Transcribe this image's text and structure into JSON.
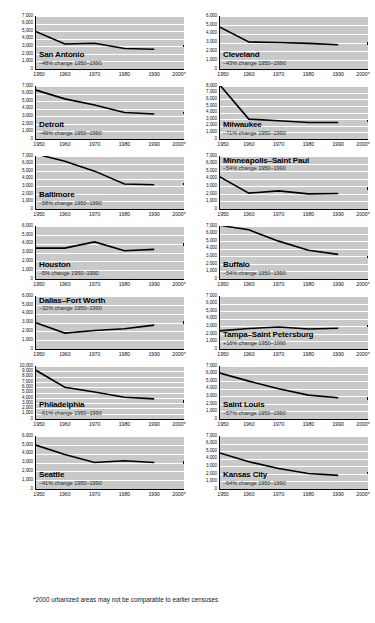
{
  "footnote": "*2000 urbanized areas may not be comparable to earlier censuses",
  "axis": {
    "x_ticks": [
      "1950",
      "1960",
      "1970",
      "1980",
      "1990",
      "2000*"
    ]
  },
  "chart_data": [
    {
      "type": "line",
      "title": "San Antonio",
      "subtitle": "–48% change 1950–1990",
      "title_position": "bottom",
      "xlabel": "",
      "ylabel": "",
      "grid": true,
      "legend": "none",
      "x": [
        "1950",
        "1960",
        "1970",
        "1980",
        "1990"
      ],
      "values": [
        5000,
        3300,
        3400,
        2700,
        2600
      ],
      "marker_2000": 3000,
      "ylim": [
        0,
        7000
      ],
      "ytick_step": 1000,
      "ytick_labels": [
        "0",
        "1,000",
        "2,000",
        "3,000",
        "4,000",
        "5,000",
        "6,000",
        "7,000"
      ]
    },
    {
      "type": "line",
      "title": "Cleveland",
      "subtitle": "–43% change 1950–1990",
      "title_position": "bottom",
      "xlabel": "",
      "ylabel": "",
      "grid": true,
      "legend": "none",
      "x": [
        "1950",
        "1960",
        "1970",
        "1980",
        "1990"
      ],
      "values": [
        4800,
        3050,
        3000,
        2900,
        2750
      ],
      "marker_2000": 2900,
      "ylim": [
        0,
        6000
      ],
      "ytick_step": 1000,
      "ytick_labels": [
        "0",
        "1,000",
        "2,000",
        "3,000",
        "4,000",
        "5,000",
        "6,000"
      ]
    },
    {
      "type": "line",
      "title": "Detroit",
      "subtitle": "–49% change 1950–1990",
      "title_position": "bottom",
      "xlabel": "",
      "ylabel": "",
      "grid": true,
      "legend": "none",
      "x": [
        "1950",
        "1960",
        "1970",
        "1980",
        "1990"
      ],
      "values": [
        6500,
        5300,
        4500,
        3500,
        3300
      ],
      "marker_2000": 3400,
      "ylim": [
        0,
        7000
      ],
      "ytick_step": 1000,
      "ytick_labels": [
        "0",
        "1,000",
        "2,000",
        "3,000",
        "4,000",
        "5,000",
        "6,000",
        "7,000"
      ]
    },
    {
      "type": "line",
      "title": "Milwaukee",
      "subtitle": "–71% change 1950–1990",
      "title_position": "bottom",
      "xlabel": "",
      "ylabel": "",
      "grid": true,
      "legend": "none",
      "x": [
        "1950",
        "1960",
        "1970",
        "1980",
        "1990"
      ],
      "values": [
        8300,
        3000,
        2750,
        2500,
        2500
      ],
      "marker_2000": 2700,
      "ylim": [
        0,
        8000
      ],
      "ytick_step": 1000,
      "ytick_labels": [
        "0",
        "1,000",
        "2,000",
        "3,000",
        "4,000",
        "5,000",
        "6,000",
        "7,000",
        "8,000"
      ]
    },
    {
      "type": "line",
      "title": "Baltimore",
      "subtitle": "–58% change 1950–1990",
      "title_position": "bottom",
      "xlabel": "",
      "ylabel": "",
      "grid": true,
      "legend": "none",
      "x": [
        "1950",
        "1960",
        "1970",
        "1980",
        "1990"
      ],
      "values": [
        7300,
        6300,
        5000,
        3300,
        3200
      ],
      "marker_2000": 3300,
      "ylim": [
        0,
        7000
      ],
      "ytick_step": 1000,
      "ytick_labels": [
        "0",
        "1,000",
        "2,000",
        "3,000",
        "4,000",
        "5,000",
        "6,000",
        "7,000"
      ]
    },
    {
      "type": "line",
      "title": "Minneapolis–Saint Paul",
      "subtitle": "–54% change 1950–1990",
      "title_position": "top",
      "xlabel": "",
      "ylabel": "",
      "grid": true,
      "legend": "none",
      "x": [
        "1950",
        "1960",
        "1970",
        "1980",
        "1990"
      ],
      "values": [
        4300,
        2100,
        2400,
        2000,
        2050
      ],
      "marker_2000": 2700,
      "ylim": [
        0,
        7000
      ],
      "ytick_step": 1000,
      "ytick_labels": [
        "0",
        "1,000",
        "2,000",
        "3,000",
        "4,000",
        "5,000",
        "6,000",
        "7,000"
      ]
    },
    {
      "type": "line",
      "title": "Houston",
      "subtitle": "–5% change 1950–1990",
      "title_position": "bottom",
      "xlabel": "",
      "ylabel": "",
      "grid": true,
      "legend": "none",
      "x": [
        "1950",
        "1960",
        "1970",
        "1980",
        "1990"
      ],
      "values": [
        3500,
        3500,
        4200,
        3200,
        3350
      ],
      "marker_2000": 3900,
      "ylim": [
        0,
        6000
      ],
      "ytick_step": 1000,
      "ytick_labels": [
        "0",
        "1,000",
        "2,000",
        "3,000",
        "4,000",
        "5,000",
        "6,000"
      ]
    },
    {
      "type": "line",
      "title": "Buffalo",
      "subtitle": "–54% change 1950–1990",
      "title_position": "bottom",
      "xlabel": "",
      "ylabel": "",
      "grid": true,
      "legend": "none",
      "x": [
        "1950",
        "1960",
        "1970",
        "1980",
        "1990"
      ],
      "values": [
        7100,
        6500,
        5000,
        3800,
        3250
      ],
      "marker_2000": 2900,
      "ylim": [
        0,
        7000
      ],
      "ytick_step": 1000,
      "ytick_labels": [
        "0",
        "1,000",
        "2,000",
        "3,000",
        "4,000",
        "5,000",
        "6,000",
        "7,000"
      ]
    },
    {
      "type": "line",
      "title": "Dallas–Fort Worth",
      "subtitle": "–32% change 1950–1990",
      "title_position": "top",
      "xlabel": "",
      "ylabel": "",
      "grid": true,
      "legend": "none",
      "x": [
        "1950",
        "1960",
        "1970",
        "1980",
        "1990"
      ],
      "values": [
        3000,
        1800,
        2100,
        2300,
        2700
      ],
      "marker_2000": 3000,
      "ylim": [
        0,
        6000
      ],
      "ytick_step": 1000,
      "ytick_labels": [
        "0",
        "1,000",
        "2,000",
        "3,000",
        "4,000",
        "5,000",
        "6,000"
      ]
    },
    {
      "type": "line",
      "title": "Tampa–Saint Petersburg",
      "subtitle": "+16% change 1950–1990",
      "title_position": "bottom",
      "xlabel": "",
      "ylabel": "",
      "grid": true,
      "legend": "none",
      "x": [
        "1950",
        "1960",
        "1970",
        "1980",
        "1990"
      ],
      "values": [
        2400,
        2700,
        2900,
        2650,
        2750
      ],
      "marker_2000": 3000,
      "ylim": [
        0,
        7000
      ],
      "ytick_step": 1000,
      "ytick_labels": [
        "0",
        "1,000",
        "2,000",
        "3,000",
        "4,000",
        "5,000",
        "6,000",
        "7,000"
      ]
    },
    {
      "type": "line",
      "title": "Philadelphia",
      "subtitle": "–61% change 1950–1990",
      "title_position": "bottom",
      "xlabel": "",
      "ylabel": "",
      "grid": true,
      "legend": "none",
      "x": [
        "1950",
        "1960",
        "1970",
        "1980",
        "1990"
      ],
      "values": [
        9300,
        6000,
        5100,
        4100,
        3800
      ],
      "marker_2000": 3300,
      "ylim": [
        0,
        10000
      ],
      "ytick_step": 1000,
      "ytick_labels": [
        "0",
        "1,000",
        "2,000",
        "3,000",
        "4,000",
        "5,000",
        "6,000",
        "7,000",
        "8,000",
        "9,000",
        "10,000"
      ]
    },
    {
      "type": "line",
      "title": "Saint Louis",
      "subtitle": "–57% change 1950–1990",
      "title_position": "bottom",
      "xlabel": "",
      "ylabel": "",
      "grid": true,
      "legend": "none",
      "x": [
        "1950",
        "1960",
        "1970",
        "1980",
        "1990"
      ],
      "values": [
        6100,
        5000,
        4000,
        3150,
        2800
      ],
      "marker_2000": 2700,
      "ylim": [
        0,
        7000
      ],
      "ytick_step": 1000,
      "ytick_labels": [
        "0",
        "1,000",
        "2,000",
        "3,000",
        "4,000",
        "5,000",
        "6,000",
        "7,000"
      ]
    },
    {
      "type": "line",
      "title": "Seattle",
      "subtitle": "–41% change 1950–1990",
      "title_position": "bottom",
      "xlabel": "",
      "ylabel": "",
      "grid": true,
      "legend": "none",
      "x": [
        "1950",
        "1960",
        "1970",
        "1980",
        "1990"
      ],
      "values": [
        5000,
        3900,
        3000,
        3200,
        3000
      ],
      "marker_2000": 3000,
      "ylim": [
        0,
        6000
      ],
      "ytick_step": 1000,
      "ytick_labels": [
        "0",
        "1,000",
        "2,000",
        "3,000",
        "4,000",
        "5,000",
        "6,000"
      ]
    },
    {
      "type": "line",
      "title": "Kansas City",
      "subtitle": "–64% change 1950–1990",
      "title_position": "bottom",
      "xlabel": "",
      "ylabel": "",
      "grid": true,
      "legend": "none",
      "x": [
        "1950",
        "1960",
        "1970",
        "1980",
        "1990"
      ],
      "values": [
        4800,
        3600,
        2700,
        2050,
        1800
      ],
      "marker_2000": 2100,
      "ylim": [
        0,
        7000
      ],
      "ytick_step": 1000,
      "ytick_labels": [
        "0",
        "1,000",
        "2,000",
        "3,000",
        "4,000",
        "5,000",
        "6,000",
        "7,000"
      ]
    }
  ]
}
